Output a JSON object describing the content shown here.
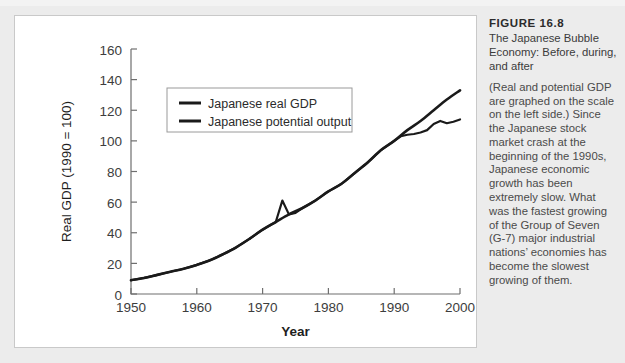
{
  "figure": {
    "number": "FIGURE 16.8",
    "subtitle": "The Japanese Bubble Economy: Before, during, and after",
    "body": "(Real and potential GDP are graphed on the scale on the left side.) Since the Japanese stock market crash at the beginning of the 1990s, Japanese economic growth has been extremely slow. What was the fastest growing of the Group of Seven (G-7) major industrial nations’ economies has become the slowest growing of them."
  },
  "colors": {
    "page_background": "#ececec",
    "panel_background": "#ffffff",
    "panel_border": "#c9c9c9",
    "axis": "#6f6f6f",
    "series_line": "#1a1a1a",
    "tick_label": "#3d3d3d",
    "axis_title": "#1f1f1f"
  },
  "chart_data": {
    "type": "line",
    "title": "",
    "xlabel": "Year",
    "ylabel": "Real GDP (1990 = 100)",
    "xlim": [
      1950,
      2000
    ],
    "ylim": [
      0,
      160
    ],
    "xticks": [
      1950,
      1960,
      1970,
      1980,
      1990,
      2000
    ],
    "yticks": [
      0,
      20,
      40,
      60,
      80,
      100,
      120,
      140,
      160
    ],
    "grid": false,
    "legend_position": "upper-left-inside",
    "series": [
      {
        "name": "Japanese real GDP",
        "color": "#1a1a1a",
        "x": [
          1950,
          1952,
          1954,
          1956,
          1958,
          1960,
          1962,
          1964,
          1966,
          1968,
          1970,
          1972,
          1973,
          1974,
          1975,
          1976,
          1978,
          1980,
          1982,
          1984,
          1986,
          1988,
          1990,
          1991,
          1992,
          1993,
          1994,
          1995,
          1996,
          1997,
          1998,
          1999,
          2000
        ],
        "y": [
          9,
          10.5,
          12.5,
          14.5,
          16.5,
          19,
          22,
          26,
          30.5,
          36,
          42,
          47,
          61,
          52,
          53,
          56,
          61,
          67,
          72,
          79,
          86,
          94,
          100,
          103,
          104,
          104.5,
          105.5,
          107,
          111,
          113,
          111.5,
          112.5,
          114
        ]
      },
      {
        "name": "Japanese potential output",
        "color": "#1a1a1a",
        "x": [
          1950,
          1952,
          1954,
          1956,
          1958,
          1960,
          1962,
          1964,
          1966,
          1968,
          1970,
          1972,
          1974,
          1976,
          1978,
          1980,
          1982,
          1984,
          1986,
          1988,
          1990,
          1992,
          1994,
          1996,
          1998,
          2000
        ],
        "y": [
          9,
          10.5,
          12.5,
          14.5,
          16.5,
          19,
          22,
          26,
          30.5,
          36,
          42,
          47,
          52,
          56,
          61,
          67,
          72,
          79,
          86,
          94,
          100,
          107,
          113,
          120,
          127,
          133
        ]
      }
    ],
    "legend": [
      {
        "label": "Japanese real GDP",
        "color": "#1a1a1a"
      },
      {
        "label": "Japanese potential output",
        "color": "#1a1a1a"
      }
    ]
  }
}
